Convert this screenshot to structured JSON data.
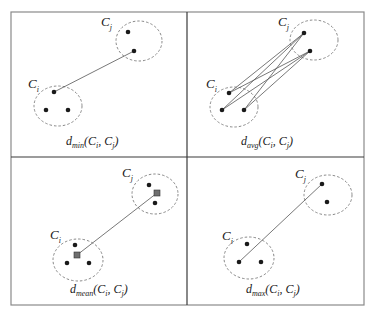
{
  "figure": {
    "panels": [
      {
        "id": "min",
        "caption_prefix": "d",
        "caption_sub": "min",
        "caption_args": "(C",
        "arg_i": "i",
        "comma": ", C",
        "arg_j": "j",
        "close": ")",
        "cluster_i_label": "C",
        "cluster_i_sub": "i",
        "cluster_j_label": "C",
        "cluster_j_sub": "j",
        "linkage": "single (minimum distance between closest points)"
      },
      {
        "id": "avg",
        "caption_prefix": "d",
        "caption_sub": "avg",
        "caption_args": "(C",
        "arg_i": "i",
        "comma": ", C",
        "arg_j": "j",
        "close": ")",
        "cluster_i_label": "C",
        "cluster_i_sub": "i",
        "cluster_j_label": "C",
        "cluster_j_sub": "j",
        "linkage": "average (all pairwise distances)"
      },
      {
        "id": "mean",
        "caption_prefix": "d",
        "caption_sub": "mean",
        "caption_args": "(C",
        "arg_i": "i",
        "comma": ", C",
        "arg_j": "j",
        "close": ")",
        "cluster_i_label": "C",
        "cluster_i_sub": "i",
        "cluster_j_label": "C",
        "cluster_j_sub": "j",
        "linkage": "centroid (distance between cluster means)"
      },
      {
        "id": "max",
        "caption_prefix": "d",
        "caption_sub": "max",
        "caption_args": "(C",
        "arg_i": "i",
        "comma": ", C",
        "arg_j": "j",
        "close": ")",
        "cluster_i_label": "C",
        "cluster_i_sub": "i",
        "cluster_j_label": "C",
        "cluster_j_sub": "j",
        "linkage": "complete (maximum distance between farthest points)"
      }
    ],
    "colors": {
      "point": "#1a1a1a",
      "centroid": "#6e6e6e",
      "cluster_outline": "#7a7a7a",
      "link": "#555555",
      "divider": "#3a3a3a"
    }
  }
}
